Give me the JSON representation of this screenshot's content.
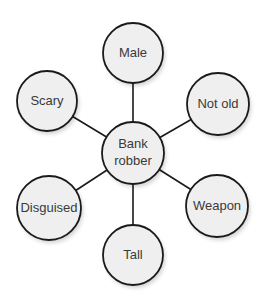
{
  "diagram": {
    "type": "hub-and-spoke concept map",
    "center": {
      "id": "bank-robber",
      "label_line1": "Bank",
      "label_line2": "robber",
      "x": 133,
      "y": 153,
      "r": 31
    },
    "nodes": [
      {
        "id": "male",
        "label": "Male",
        "x": 133,
        "y": 53,
        "r": 30
      },
      {
        "id": "not-old",
        "label": "Not old",
        "x": 218,
        "y": 104,
        "r": 31
      },
      {
        "id": "weapon",
        "label": "Weapon",
        "x": 217,
        "y": 206,
        "r": 31
      },
      {
        "id": "tall",
        "label": "Tall",
        "x": 133,
        "y": 255,
        "r": 30
      },
      {
        "id": "disguised",
        "label": "Disguised",
        "x": 49,
        "y": 208,
        "r": 32
      },
      {
        "id": "scary",
        "label": "Scary",
        "x": 47,
        "y": 101,
        "r": 30
      }
    ],
    "colors": {
      "node_fill": "#efefef",
      "stroke": "#1a1a1a",
      "text": "#3a3a3a",
      "background": "#ffffff"
    }
  }
}
